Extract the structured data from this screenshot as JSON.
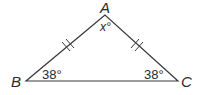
{
  "diagram": {
    "type": "isosceles-triangle",
    "vertices": [
      {
        "name": "A",
        "label": "A",
        "x": 105,
        "y": 15
      },
      {
        "name": "B",
        "label": "B",
        "x": 26,
        "y": 81
      },
      {
        "name": "C",
        "label": "C",
        "x": 178,
        "y": 81
      }
    ],
    "angles": {
      "A": "x°",
      "B": "38°",
      "C": "38°"
    },
    "congruent_sides": [
      "AB",
      "AC"
    ],
    "tick_marks_per_side": 2,
    "colors": {
      "stroke": "#3a3a3a",
      "text": "#2a2a2a",
      "background": "#ffffff"
    }
  }
}
